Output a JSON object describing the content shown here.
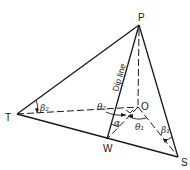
{
  "diagram": {
    "type": "3D geometry / structural geology dip diagram",
    "points": {
      "P": {
        "label": "P",
        "x": 139,
        "y": 25
      },
      "O": {
        "label": "O",
        "x": 138,
        "y": 107
      },
      "T": {
        "label": "T",
        "x": 17,
        "y": 114
      },
      "W": {
        "label": "W",
        "x": 107,
        "y": 139
      },
      "S": {
        "label": "S",
        "x": 178,
        "y": 157
      }
    },
    "labels": {
      "P": "P",
      "O": "O",
      "T": "T",
      "W": "W",
      "S": "S",
      "dip_line": "Dip line",
      "beta2": "β₂",
      "beta1": "β₁",
      "theta2": "θ₂",
      "theta1": "θ₁",
      "alpha": "α"
    },
    "solid_edges": [
      "P-T",
      "P-W",
      "P-S",
      "T-W",
      "T-S",
      "W-S"
    ],
    "dashed_edges": [
      "P-O",
      "T-O",
      "O-S",
      "O-W"
    ],
    "colors": {
      "line": "#1a1a1a",
      "background": "#ffffff"
    }
  }
}
